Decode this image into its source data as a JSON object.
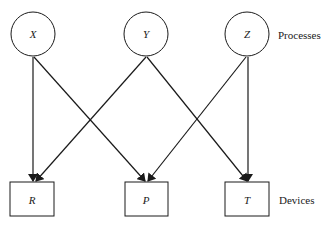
{
  "diagram": {
    "processes_label": "Processes",
    "devices_label": "Devices",
    "processes": [
      {
        "id": "X",
        "label": "X"
      },
      {
        "id": "Y",
        "label": "Y"
      },
      {
        "id": "Z",
        "label": "Z"
      }
    ],
    "devices": [
      {
        "id": "R",
        "label": "R"
      },
      {
        "id": "P",
        "label": "P"
      },
      {
        "id": "T",
        "label": "T"
      }
    ],
    "edges": [
      {
        "from": "X",
        "to": "R"
      },
      {
        "from": "X",
        "to": "P"
      },
      {
        "from": "Y",
        "to": "R"
      },
      {
        "from": "Y",
        "to": "T"
      },
      {
        "from": "Z",
        "to": "P"
      },
      {
        "from": "Z",
        "to": "T"
      }
    ]
  }
}
